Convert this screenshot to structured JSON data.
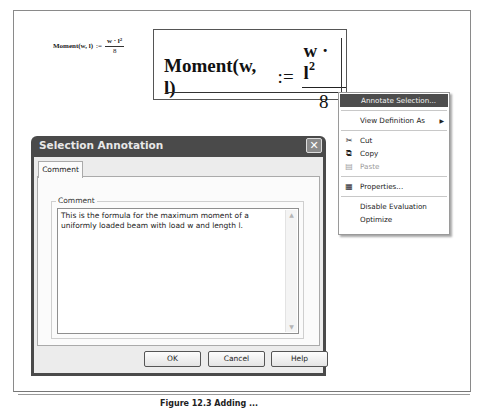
{
  "worksheet": {
    "small_formula": {
      "lhs": "Moment(w, l)",
      "assign": ":=",
      "numerator": "w · l",
      "exponent": "2",
      "denominator": "8"
    },
    "big_formula": {
      "lhs": "Moment(w, l)",
      "assign": ":=",
      "numerator": "w · l",
      "exponent": "2",
      "denominator": "8"
    }
  },
  "context_menu": {
    "items": [
      {
        "label": "Annotate Selection...",
        "highlighted": true
      },
      {
        "label": "View Definition As",
        "submenu": true
      },
      {
        "label": "Cut",
        "icon": "scissors-icon"
      },
      {
        "label": "Copy",
        "icon": "copy-icon"
      },
      {
        "label": "Paste",
        "icon": "paste-icon",
        "disabled": true
      },
      {
        "label": "Properties...",
        "icon": "properties-icon"
      },
      {
        "label": "Disable Evaluation"
      },
      {
        "label": "Optimize"
      }
    ],
    "submenu_arrow": "▶",
    "icons": {
      "cut": "✂",
      "copy": "⧉",
      "paste": "▤",
      "properties": "▦"
    }
  },
  "dialog": {
    "title": "Selection Annotation",
    "close_glyph": "✕",
    "tab_label": "Comment",
    "group_label": "Comment",
    "comment_text": "This is the formula for the maximum moment of a uniformly loaded beam with load w and length l.",
    "scroll_up": "▲",
    "scroll_down": "▼",
    "buttons": {
      "ok": "OK",
      "cancel": "Cancel",
      "help": "Help"
    }
  },
  "caption": "Figure 12.3 Adding ..."
}
